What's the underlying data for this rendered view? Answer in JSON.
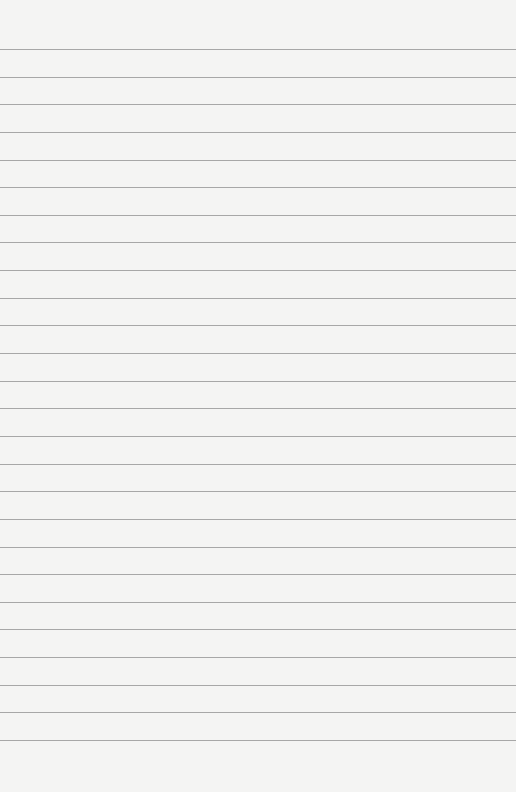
{
  "page": {
    "type": "lined-notepaper",
    "background_color": "#f4f4f3",
    "line_color": "#8e8e8e",
    "first_line_y": 49,
    "line_spacing": 27.64,
    "line_count": 26
  }
}
